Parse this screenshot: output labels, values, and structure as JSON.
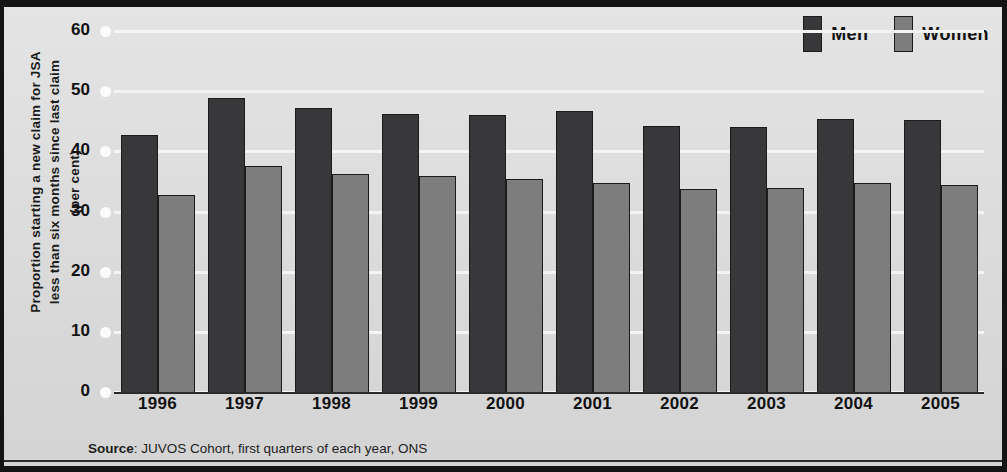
{
  "chart_data": {
    "type": "bar",
    "title": "",
    "subtitle": "",
    "xlabel": "",
    "ylabel": "Proportion starting a new claim for JSA less than six months since last claim (per cent)",
    "ylabel_lines": [
      "Proportion starting a new claim for JSA",
      "less than six months since last claim",
      "(per cent)"
    ],
    "categories": [
      "1996",
      "1997",
      "1998",
      "1999",
      "2000",
      "2001",
      "2002",
      "2003",
      "2004",
      "2005"
    ],
    "series": [
      {
        "name": "Men",
        "color": "#38383a",
        "values": [
          43.0,
          49.2,
          47.5,
          46.5,
          46.4,
          47.1,
          44.6,
          44.4,
          45.7,
          45.5
        ]
      },
      {
        "name": "Women",
        "color": "#7d7d7d",
        "values": [
          33.0,
          37.9,
          36.5,
          36.2,
          35.8,
          35.1,
          34.0,
          34.2,
          35.0,
          34.8
        ]
      }
    ],
    "ylim": [
      0,
      60
    ],
    "yticks": [
      0,
      10,
      20,
      30,
      40,
      50,
      60
    ],
    "ytick_labels": [
      "0",
      "10",
      "20",
      "30",
      "40",
      "50",
      "60"
    ],
    "grid": true,
    "legend_position": "top-right"
  },
  "legend": {
    "items": [
      {
        "label": "Men",
        "color": "#38383a"
      },
      {
        "label": "Women",
        "color": "#7d7d7d"
      }
    ]
  },
  "source": {
    "prefix": "Source",
    "separator": ": ",
    "text": "JUVOS Cohort, first quarters of each year, ONS",
    "full": "Source: JUVOS Cohort, first quarters of each year, ONS"
  },
  "colors": {
    "men_bar": "#38383a",
    "women_bar": "#7d7d7d",
    "background": "#dcdcdc",
    "gridline": "#f4f4f4",
    "frame": "#141414",
    "text": "#111111"
  }
}
